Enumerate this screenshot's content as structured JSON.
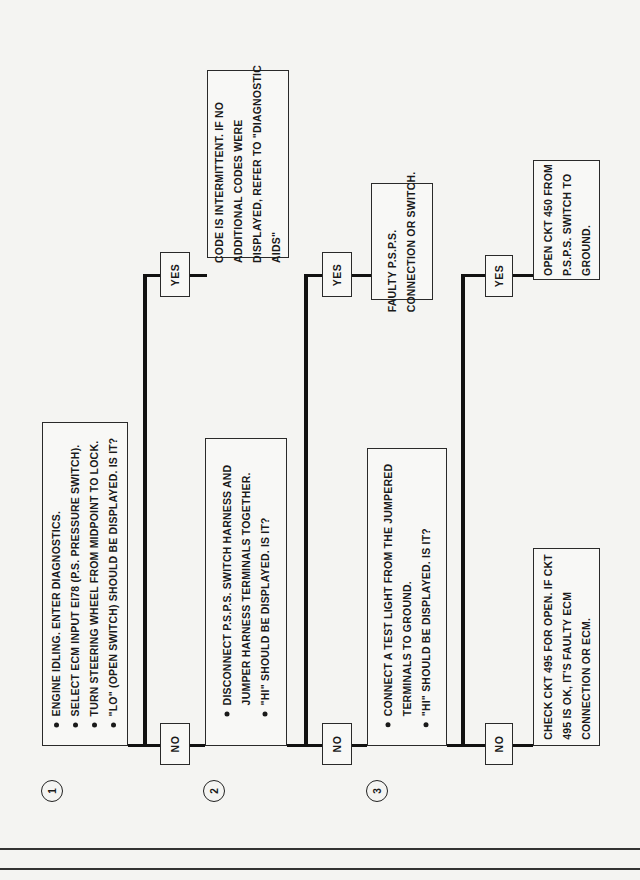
{
  "flowchart": {
    "orientation": "rotated-90-ccw",
    "steps": [
      {
        "number": "1",
        "bullets": [
          "ENGINE IDLING.  ENTER DIAGNOSTICS.",
          "SELECT ECM INPUT EI78 (P.S. PRESSURE SWITCH).",
          "TURN STEERING WHEEL FROM MIDPOINT TO LOCK.",
          "\"LO\" (OPEN SWITCH) SHOULD BE DISPLAYED.  IS IT?"
        ],
        "yes_label": "YES",
        "yes_result": [
          "CODE IS INTERMITTENT. IF NO",
          "ADDITIONAL CODES WERE",
          "DISPLAYED, REFER TO \"DIAGNOSTIC",
          "AIDS\""
        ],
        "no_label": "NO"
      },
      {
        "number": "2",
        "bullets": [
          "DISCONNECT P.S.P.S. SWITCH HARNESS AND\nJUMPER HARNESS TERMINALS TOGETHER.",
          "\"HI\" SHOULD BE DISPLAYED.  IS IT?"
        ],
        "yes_label": "YES",
        "yes_result": [
          "FAULTY P.S.P.S.",
          "CONNECTION OR SWITCH."
        ],
        "no_label": "NO"
      },
      {
        "number": "3",
        "bullets": [
          "CONNECT A TEST LIGHT FROM THE JUMPERED\nTERMINALS TO GROUND.",
          "\"HI\" SHOULD BE DISPLAYED.  IS IT?"
        ],
        "yes_label": "YES",
        "yes_result": [
          "OPEN CKT 450 FROM",
          "P.S.P.S. SWITCH TO",
          "GROUND."
        ],
        "no_label": "NO",
        "no_result": [
          "CHECK CKT 495 FOR OPEN.  IF CKT",
          "495 IS OK, IT'S FAULTY ECM",
          "CONNECTION OR ECM."
        ]
      }
    ]
  },
  "colors": {
    "paper": "#f4f4f2",
    "ink": "#1a1a1a"
  }
}
